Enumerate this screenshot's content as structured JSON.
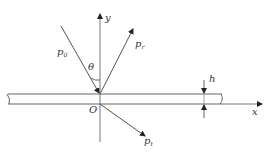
{
  "diagram": {
    "title": "",
    "colors": {
      "line": "#555555",
      "text": "#333333",
      "background": "#ffffff"
    },
    "axes": {
      "x_label": "x",
      "y_label": "y",
      "origin_label": "O"
    },
    "rays": {
      "incident": {
        "label_main": "p",
        "label_sub": "0"
      },
      "reflected": {
        "label_main": "p",
        "label_sub": "r"
      },
      "transmitted": {
        "label_main": "p",
        "label_sub": "t"
      }
    },
    "angle": {
      "label": "θ"
    },
    "plate": {
      "thickness_label": "h"
    }
  }
}
